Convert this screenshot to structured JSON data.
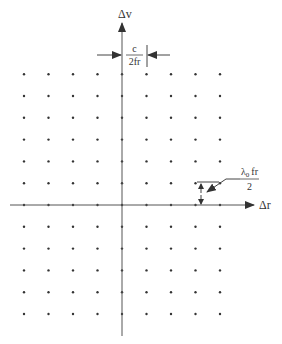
{
  "diagram": {
    "title": "",
    "axes": {
      "horizontal_label": "Δr",
      "vertical_label": "Δv"
    },
    "grid": {
      "columns": 9,
      "rows": 12,
      "origin_column_index": 4,
      "origin_row_index": 6,
      "description": "Regular lattice of ambiguity points"
    },
    "annotations": {
      "horizontal_spacing": {
        "numerator": "c",
        "denominator": "2fr"
      },
      "vertical_spacing": {
        "numerator_main": "λ",
        "numerator_sub": "0",
        "numerator_rest": "fr",
        "denominator": "2"
      }
    },
    "colors": {
      "ink": "#333333",
      "background": "#ffffff"
    }
  }
}
